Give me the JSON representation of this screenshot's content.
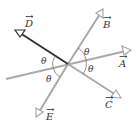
{
  "diagram": {
    "title": "",
    "vectors": [
      {
        "name": "A",
        "label": "A",
        "arrow": "→"
      },
      {
        "name": "B",
        "label": "B",
        "arrow": "→"
      },
      {
        "name": "C",
        "label": "C",
        "arrow": "→"
      },
      {
        "name": "D",
        "label": "D",
        "arrow": "→"
      },
      {
        "name": "E",
        "label": "E",
        "arrow": "→"
      }
    ],
    "angles": [
      "θ",
      "θ",
      "θ",
      "θ"
    ],
    "colors": {
      "light_line": "#a9a9a9",
      "dark_line": "#333333",
      "text": "#333333"
    }
  }
}
